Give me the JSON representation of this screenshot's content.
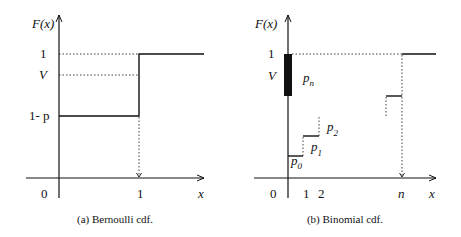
{
  "figures": [
    {
      "id": "a",
      "caption": "(a) Bernoulli cdf.",
      "y_axis_label": "F(x)",
      "x_axis_label": "x",
      "y_ticks": [
        "1",
        "V",
        "1- p"
      ],
      "x_ticks": [
        "0",
        "1"
      ]
    },
    {
      "id": "b",
      "caption": "(b) Binomial cdf.",
      "y_axis_label": "F(x)",
      "x_axis_label": "x",
      "y_ticks": [
        "1",
        "V"
      ],
      "x_ticks": [
        "0",
        "1",
        "2",
        "n"
      ],
      "step_labels": {
        "p0": {
          "base": "p",
          "sub": "0"
        },
        "p1": {
          "base": "p",
          "sub": "1"
        },
        "p2": {
          "base": "p",
          "sub": "2"
        },
        "pn": {
          "base": "p",
          "sub": "n"
        }
      }
    }
  ]
}
